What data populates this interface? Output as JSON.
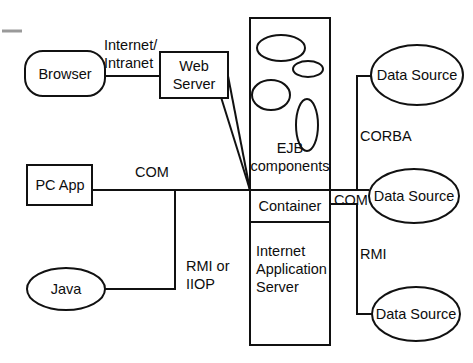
{
  "diagram": {
    "stroke_color": "#111111",
    "background_color": "#ffffff",
    "nodes": {
      "browser": {
        "label": "Browser",
        "shape": "rounded-rectangle"
      },
      "web_server": {
        "label_line1": "Web",
        "label_line2": "Server",
        "shape": "rectangle"
      },
      "pc_app": {
        "label": "PC App",
        "shape": "rectangle"
      },
      "java": {
        "label": "Java",
        "shape": "ellipse"
      },
      "ejb": {
        "label_line1": "EJB",
        "label_line2": "components",
        "shape": "rectangle-with-ellipses"
      },
      "container": {
        "label": "Container",
        "shape": "rectangle"
      },
      "ias": {
        "label_line1": "Internet",
        "label_line2": "Application",
        "label_line3": "Server",
        "shape": "rectangle"
      },
      "data_source_1": {
        "label": "Data Source",
        "shape": "ellipse"
      },
      "data_source_2": {
        "label": "Data Source",
        "shape": "ellipse"
      },
      "data_source_3": {
        "label": "Data Source",
        "shape": "ellipse"
      }
    },
    "edge_labels": {
      "internet_intranet_line1": "Internet/",
      "internet_intranet_line2": "Intranet",
      "com_left": "COM",
      "rmi_or_iiop_line1": "RMI or",
      "rmi_or_iiop_line2": "IIOP",
      "corba": "CORBA",
      "com_right": "COM",
      "rmi": "RMI"
    }
  }
}
